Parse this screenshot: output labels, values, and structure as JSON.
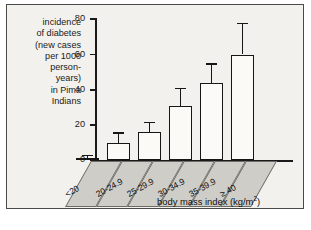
{
  "chart_data": {
    "type": "bar",
    "title": "",
    "xlabel": "body mass index (kg/m2)",
    "ylabel": "incidence of diabetes (new cases per 1000 person-years) in Pima Indians",
    "categories": [
      "<20",
      "20-24.9",
      "25-29.9",
      "30-34.9",
      "35-39.9",
      "≥ 40"
    ],
    "values": [
      1.5,
      10,
      16,
      31,
      44,
      60
    ],
    "error_upper": [
      3,
      16,
      22,
      41,
      55,
      78
    ],
    "ylim": [
      0,
      80
    ],
    "yticks": [
      0,
      20,
      40,
      60,
      80
    ],
    "ytick_labels": [
      "0",
      "20",
      "40",
      "60",
      "80"
    ],
    "grid": false,
    "legend": null
  },
  "axes": {
    "y_caption_lines": [
      "incidence",
      "of diabetes",
      "(new cases",
      "per 1000",
      "person-",
      "years)",
      "in Pima",
      "Indians"
    ],
    "x_title_main": "body mass index (kg/m",
    "x_title_sup": "2",
    "x_title_end": ")"
  },
  "colors": {
    "frame": "#4a4a46",
    "background": "#f2f1ed",
    "bar_fill": "#fbfaf7",
    "bar_stroke": "#161616",
    "base_plate": "#cfcdc8",
    "axis": "#1a1a1a"
  }
}
